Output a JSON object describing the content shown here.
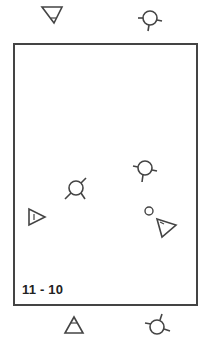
{
  "diagram": {
    "type": "formation-diagram",
    "label": "11 - 10",
    "colors": {
      "stroke": "#444444",
      "background": "#ffffff",
      "text": "#222222"
    },
    "court": {
      "x": 13,
      "y": 43,
      "width": 183,
      "height": 261
    },
    "symbols": [
      {
        "id": "top-left-triangle",
        "shape": "triangle-down",
        "x": 52,
        "y": 14,
        "region": "outside-top"
      },
      {
        "id": "top-right-circle",
        "shape": "circle-with-ticks",
        "x": 149,
        "y": 19,
        "region": "outside-top"
      },
      {
        "id": "inner-circle-upper-right",
        "shape": "circle-with-ticks",
        "x": 143,
        "y": 168,
        "region": "inside"
      },
      {
        "id": "inner-circle-center",
        "shape": "circle-with-ticks",
        "x": 75,
        "y": 189,
        "region": "inside"
      },
      {
        "id": "inner-triangle-left",
        "shape": "triangle-right",
        "x": 36,
        "y": 216,
        "region": "inside"
      },
      {
        "id": "inner-small-circle",
        "shape": "small-circle",
        "x": 149,
        "y": 211,
        "region": "inside"
      },
      {
        "id": "inner-triangle-right",
        "shape": "triangle-down-left",
        "x": 166,
        "y": 227,
        "region": "inside"
      },
      {
        "id": "bottom-left-triangle",
        "shape": "triangle-up",
        "x": 74,
        "y": 326,
        "region": "outside-bottom"
      },
      {
        "id": "bottom-right-circle",
        "shape": "circle-with-ticks",
        "x": 157,
        "y": 326,
        "region": "outside-bottom"
      }
    ]
  }
}
